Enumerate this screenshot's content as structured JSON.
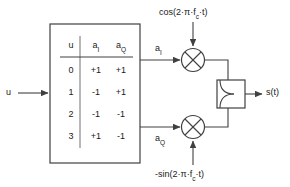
{
  "diagram": {
    "input_label": "u",
    "output_label": "s(t)",
    "branch_labels": {
      "inphase": "a",
      "inphase_sub": "I",
      "quadrature": "a",
      "quadrature_sub": "Q"
    },
    "carriers": {
      "top": "cos(2·π·f",
      "top_sub": "c",
      "top_tail": "·t)",
      "bottom": "-sin(2·π·f",
      "bottom_sub": "c",
      "bottom_tail": "·t)"
    },
    "mapping_table": {
      "headers": [
        {
          "text": "u",
          "sub": ""
        },
        {
          "text": "a",
          "sub": "I"
        },
        {
          "text": "a",
          "sub": "Q"
        }
      ],
      "rows": [
        {
          "u": "0",
          "aI": "+1",
          "aQ": "+1"
        },
        {
          "u": "1",
          "aI": "-1",
          "aQ": "+1"
        },
        {
          "u": "2",
          "aI": "-1",
          "aQ": "-1"
        },
        {
          "u": "3",
          "aI": "+1",
          "aQ": "-1"
        }
      ]
    },
    "icons": {
      "multiplier_top": "multiplier-circle-x-icon",
      "multiplier_bottom": "multiplier-circle-x-icon",
      "combiner": "signal-combiner-icon",
      "input_arrow": "arrow-right-icon",
      "output_arrow": "arrow-right-icon"
    },
    "colors": {
      "stroke": "#404040",
      "text": "#1a1a1a",
      "background": "#ffffff"
    }
  }
}
